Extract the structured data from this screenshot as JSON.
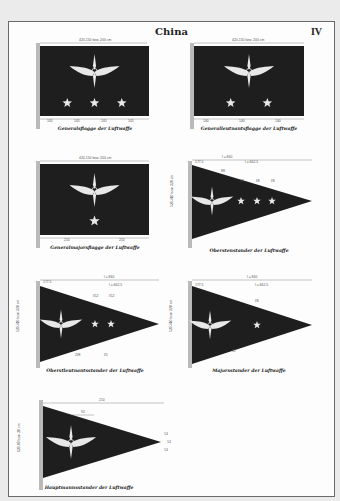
{
  "page": {
    "title": "China",
    "plate_number": "IV"
  },
  "colors": {
    "flag_field": "#1e1e1e",
    "emblem": "#e8e8e8",
    "dimension_lines": "#7a7a7a",
    "page_background": "#ebebeb",
    "panel_background": "#fdfdfd"
  },
  "figures": [
    {
      "id": "generalsflagge",
      "caption": "Generalsflagge der Luftwaffe",
      "shape": "rectangle",
      "stars": 3,
      "width_label": "420-150 bzw. 200 cm",
      "sub_labels": [
        "105",
        "105",
        "105",
        "105"
      ]
    },
    {
      "id": "generalleutnantsflagge",
      "caption": "Generalleutnantsflagge der Luftwaffe",
      "shape": "rectangle",
      "stars": 2,
      "width_label": "420-150 bzw. 200 cm",
      "sub_labels": [
        "140",
        "140",
        "140"
      ]
    },
    {
      "id": "generalmajorsflagge",
      "caption": "Generalmajorsflagge der Luftwaffe",
      "shape": "rectangle",
      "stars": 1,
      "width_label": "420-150 bzw. 200 cm",
      "sub_labels": [
        "210",
        "210"
      ]
    },
    {
      "id": "oberstenstander",
      "caption": "Oberstenstander der Luftwaffe",
      "shape": "pennant",
      "stars": 3,
      "length_label": "l = 840",
      "inner_label": "l = 662.5",
      "offset_label": "177.5",
      "height_label": "520-410 bzw. 320 cm",
      "sub_labels": [
        "88",
        "l/8",
        "l/8",
        "l/8"
      ]
    },
    {
      "id": "oberstleutnantsstander",
      "caption": "Oberstleutnantsstander der Luftwaffe",
      "shape": "pennant",
      "stars": 2,
      "length_label": "l = 840",
      "inner_label": "l = 662.5",
      "offset_label": "177.5",
      "height_label": "520-410 bzw. 320 cm",
      "sub_labels": [
        "l/12",
        "l/12",
        "2l/8",
        "l/5"
      ]
    },
    {
      "id": "majorsstander",
      "caption": "Majorsstander der Luftwaffe",
      "shape": "pennant",
      "stars": 1,
      "length_label": "l = 840",
      "inner_label": "l = 662.5",
      "offset_label": "177.5",
      "height_label": "520-410 bzw. 320 cm",
      "sub_labels": [
        "l/8",
        "l/2"
      ]
    },
    {
      "id": "hauptmannsstander",
      "caption": "Hauptmannsstander der Luftwaffe",
      "shape": "pennant",
      "stars": 0,
      "length_label": "210",
      "inner_label": "92",
      "height_label": "120-80 bzw. 30 cm",
      "sub_labels": [
        "14",
        "14",
        "14"
      ]
    }
  ]
}
